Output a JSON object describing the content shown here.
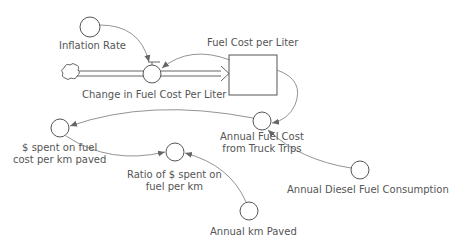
{
  "diagram": {
    "type": "stock-and-flow",
    "stocks": [
      {
        "id": "fuel_cost_per_liter",
        "label": "Fuel Cost per Liter"
      }
    ],
    "flows": [
      {
        "id": "change_in_fuel_cost",
        "label": "Change in Fuel Cost Per Liter",
        "from": "cloud-source",
        "to": "fuel_cost_per_liter"
      }
    ],
    "converters": [
      {
        "id": "inflation_rate",
        "label": "Inflation Rate"
      },
      {
        "id": "annual_fuel_cost",
        "label_line1": "Annual Fuel Cost",
        "label_line2": "from Truck Trips"
      },
      {
        "id": "spent_per_km",
        "label_line1": "$ spent on fuel",
        "label_line2": "cost per km paved"
      },
      {
        "id": "ratio",
        "label_line1": "Ratio of $ spent on",
        "label_line2": "fuel per km"
      },
      {
        "id": "annual_diesel",
        "label": "Annual Diesel Fuel Consumption"
      },
      {
        "id": "annual_km_paved",
        "label": "Annual km Paved"
      }
    ],
    "connectors": [
      {
        "from": "inflation_rate",
        "to": "change_in_fuel_cost"
      },
      {
        "from": "fuel_cost_per_liter",
        "to": "change_in_fuel_cost"
      },
      {
        "from": "fuel_cost_per_liter",
        "to": "annual_fuel_cost"
      },
      {
        "from": "annual_diesel",
        "to": "annual_fuel_cost"
      },
      {
        "from": "annual_fuel_cost",
        "to": "spent_per_km"
      },
      {
        "from": "spent_per_km",
        "to": "ratio"
      },
      {
        "from": "annual_km_paved",
        "to": "ratio"
      }
    ],
    "colors": {
      "line": "#555555",
      "text": "#555555",
      "background": "#ffffff"
    }
  }
}
